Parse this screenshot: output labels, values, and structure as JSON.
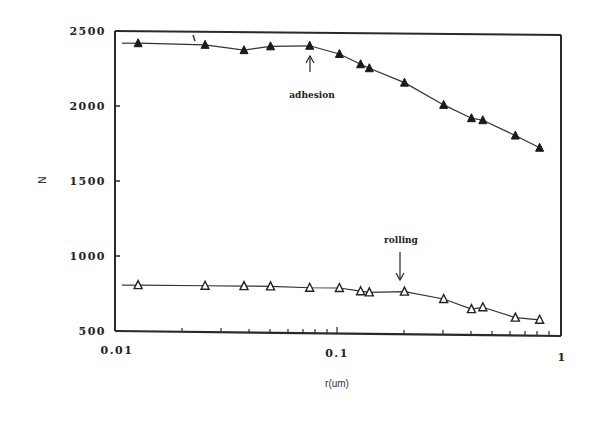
{
  "chart_data": {
    "type": "line",
    "title": "",
    "xlabel": "r(um)",
    "ylabel": "N",
    "xscale": "log",
    "xlim": [
      0.01,
      1
    ],
    "ylim": [
      500,
      2500
    ],
    "xticks": [
      "0.01",
      "0.1",
      "1"
    ],
    "yticks": [
      "500",
      "1000",
      "1500",
      "2000",
      "2500"
    ],
    "grid": false,
    "legend": null,
    "series": [
      {
        "name": "adhesion",
        "marker": "filled-triangle",
        "x": [
          0.0127,
          0.0254,
          0.038,
          0.05,
          0.075,
          0.102,
          0.127,
          0.139,
          0.2,
          0.3,
          0.4,
          0.45,
          0.63,
          0.81
        ],
        "y": [
          2420,
          2413,
          2380,
          2407,
          2413,
          2360,
          2293,
          2267,
          2173,
          2027,
          1940,
          1927,
          1827,
          1747
        ]
      },
      {
        "name": "rolling",
        "marker": "open-triangle",
        "x": [
          0.0127,
          0.0254,
          0.038,
          0.05,
          0.075,
          0.102,
          0.127,
          0.139,
          0.2,
          0.3,
          0.4,
          0.45,
          0.63,
          0.81
        ],
        "y": [
          807,
          807,
          807,
          807,
          800,
          800,
          780,
          773,
          780,
          733,
          667,
          680,
          613,
          600
        ]
      }
    ],
    "annotations": [
      {
        "text": "adhesion",
        "arrow": "up",
        "points_to_x": 0.075,
        "points_to_series": "adhesion"
      },
      {
        "text": "rolling",
        "arrow": "down",
        "points_to_x": 0.2,
        "points_to_series": "rolling"
      }
    ]
  },
  "labels": {
    "xlabel": "r(um)",
    "ylabel": "N",
    "xtick_0": "0.01",
    "xtick_1": "0.1",
    "xtick_2": "1",
    "ytick_0": "500",
    "ytick_1": "1000",
    "ytick_2": "1500",
    "ytick_3": "2000",
    "ytick_4": "2500",
    "annot_adhesion": "adhesion",
    "annot_rolling": "rolling"
  },
  "colors": {
    "ink": "#222222",
    "background": "#ffffff"
  }
}
